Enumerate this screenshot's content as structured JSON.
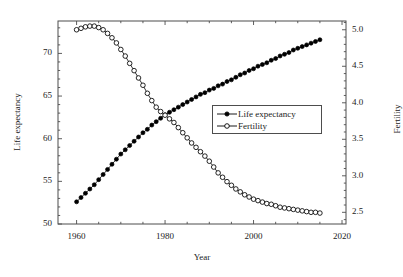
{
  "chart_data": {
    "type": "line",
    "title": "",
    "xlabel": "Year",
    "ylabel": "Life expectancy",
    "y2label": "Fertility",
    "xlim": [
      1955.8,
      2020.9
    ],
    "ylim": [
      50,
      73.8
    ],
    "y2lim": [
      2.34,
      5.12
    ],
    "xticks": [
      1960,
      1980,
      2000,
      2020
    ],
    "xtick_labels": [
      "1960",
      "1980",
      "2000",
      "2020"
    ],
    "yticks": [
      50,
      55,
      60,
      65,
      70
    ],
    "ytick_labels": [
      "50",
      "55",
      "60",
      "65",
      "70"
    ],
    "y2ticks": [
      2.5,
      3.0,
      3.5,
      4.0,
      4.5,
      5.0
    ],
    "y2tick_labels": [
      "2.5",
      "3.0",
      "3.5",
      "4.0",
      "4.5",
      "5.0"
    ],
    "minor_ticks": true,
    "grid": false,
    "legend_position": "center-right",
    "x": [
      1960,
      1961,
      1962,
      1963,
      1964,
      1965,
      1966,
      1967,
      1968,
      1969,
      1970,
      1971,
      1972,
      1973,
      1974,
      1975,
      1976,
      1977,
      1978,
      1979,
      1980,
      1981,
      1982,
      1983,
      1984,
      1985,
      1986,
      1987,
      1988,
      1989,
      1990,
      1991,
      1992,
      1993,
      1994,
      1995,
      1996,
      1997,
      1998,
      1999,
      2000,
      2001,
      2002,
      2003,
      2004,
      2005,
      2006,
      2007,
      2008,
      2009,
      2010,
      2011,
      2012,
      2013,
      2014,
      2015
    ],
    "series": [
      {
        "name": "Life expectancy",
        "axis": "left",
        "marker": "filled-circle",
        "color": "#000000",
        "values": [
          52.6,
          53.1,
          53.6,
          54.1,
          54.6,
          55.2,
          55.8,
          56.4,
          57.0,
          57.6,
          58.2,
          58.7,
          59.2,
          59.7,
          60.2,
          60.7,
          61.1,
          61.6,
          62.0,
          62.4,
          62.8,
          63.1,
          63.4,
          63.7,
          64.0,
          64.3,
          64.6,
          64.9,
          65.2,
          65.4,
          65.7,
          65.9,
          66.2,
          66.4,
          66.7,
          66.9,
          67.2,
          67.5,
          67.7,
          68.0,
          68.2,
          68.5,
          68.7,
          68.9,
          69.2,
          69.4,
          69.7,
          69.9,
          70.1,
          70.4,
          70.6,
          70.8,
          71.0,
          71.2,
          71.4,
          71.6
        ]
      },
      {
        "name": "Fertility",
        "axis": "right",
        "marker": "open-circle",
        "color": "#000000",
        "values": [
          5.0,
          5.02,
          5.04,
          5.05,
          5.05,
          5.03,
          5.0,
          4.95,
          4.89,
          4.82,
          4.73,
          4.64,
          4.54,
          4.44,
          4.34,
          4.24,
          4.13,
          4.03,
          3.94,
          3.88,
          3.83,
          3.78,
          3.73,
          3.66,
          3.59,
          3.52,
          3.45,
          3.39,
          3.33,
          3.27,
          3.2,
          3.12,
          3.04,
          2.98,
          2.92,
          2.87,
          2.82,
          2.78,
          2.74,
          2.71,
          2.68,
          2.66,
          2.64,
          2.62,
          2.61,
          2.59,
          2.57,
          2.56,
          2.55,
          2.54,
          2.53,
          2.52,
          2.51,
          2.5,
          2.5,
          2.49
        ]
      }
    ]
  },
  "legend": {
    "entries": [
      {
        "label": "Life expectancy",
        "marker": "filled-circle"
      },
      {
        "label": "Fertility",
        "marker": "open-circle"
      }
    ]
  }
}
